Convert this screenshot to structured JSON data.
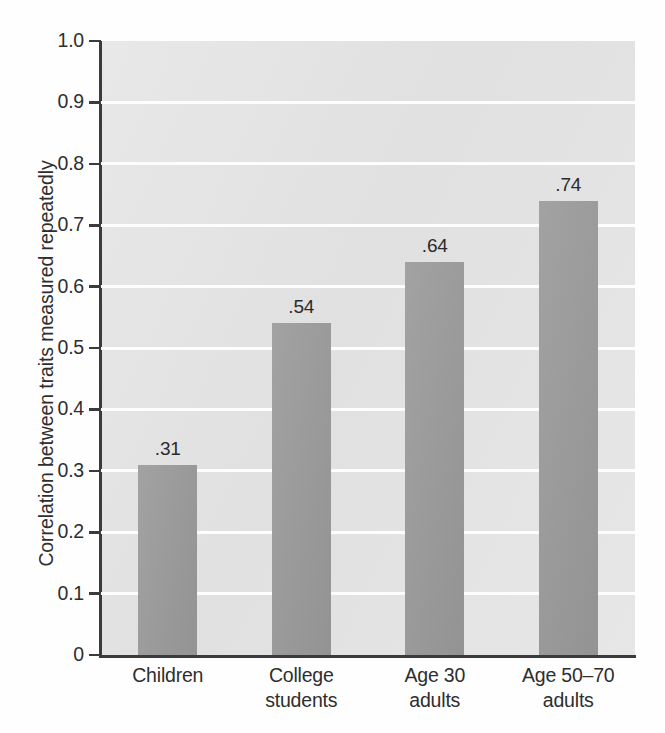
{
  "chart_data": {
    "type": "bar",
    "title": "",
    "xlabel": "",
    "ylabel": "Correlation between traits measured repeatedly",
    "categories": [
      "Children",
      "College\nstudents",
      "Age 30\nadults",
      "Age 50–70\nadults"
    ],
    "category_lines": [
      [
        "Children"
      ],
      [
        "College",
        "students"
      ],
      [
        "Age 30",
        "adults"
      ],
      [
        "Age 50–70",
        "adults"
      ]
    ],
    "values": [
      0.31,
      0.54,
      0.64,
      0.74
    ],
    "value_labels": [
      ".31",
      ".54",
      ".64",
      ".74"
    ],
    "ylim": [
      0,
      1.0
    ],
    "ytick_values": [
      1.0,
      0.9,
      0.8,
      0.7,
      0.6,
      0.5,
      0.4,
      0.3,
      0.2,
      0.1,
      0
    ],
    "ytick_labels": [
      "1.0",
      "0.9",
      "0.8",
      "0.7",
      "0.6",
      "0.5",
      "0.4",
      "0.3",
      "0.2",
      "0.1",
      "0"
    ],
    "grid": true,
    "grid_color": "#fdfdfd",
    "legend": null,
    "plot_background": "#e4e4e4",
    "bar_color": "#9b9b9b",
    "axis_color": "#3b3b3b"
  }
}
